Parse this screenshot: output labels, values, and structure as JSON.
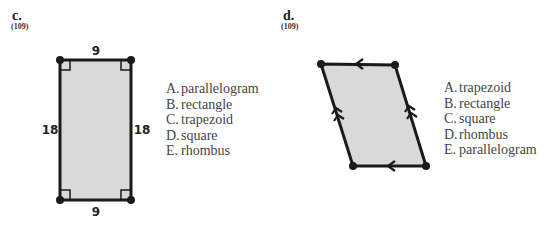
{
  "problems": [
    {
      "label": "c.",
      "ref": "(109)",
      "figure": {
        "shape": "rectangle",
        "top": "9",
        "bottom": "9",
        "left": "18",
        "right": "18",
        "marks": "right angles at all corners"
      },
      "options": [
        {
          "letter": "A.",
          "text": "parallelogram"
        },
        {
          "letter": "B.",
          "text": "rectangle"
        },
        {
          "letter": "C.",
          "text": "trapezoid"
        },
        {
          "letter": "D.",
          "text": "square"
        },
        {
          "letter": "E.",
          "text": "rhombus"
        }
      ]
    },
    {
      "label": "d.",
      "ref": "(109)",
      "figure": {
        "shape": "parallelogram",
        "marks": "single arrows on top/bottom, double arrows on left/right"
      },
      "options": [
        {
          "letter": "A.",
          "text": "trapezoid"
        },
        {
          "letter": "B.",
          "text": "rectangle"
        },
        {
          "letter": "C.",
          "text": "square"
        },
        {
          "letter": "D.",
          "text": "rhombus"
        },
        {
          "letter": "E.",
          "text": "parallelogram"
        }
      ]
    }
  ],
  "colors": {
    "fill": "#d9d9d9",
    "stroke": "#1a1a1a"
  }
}
